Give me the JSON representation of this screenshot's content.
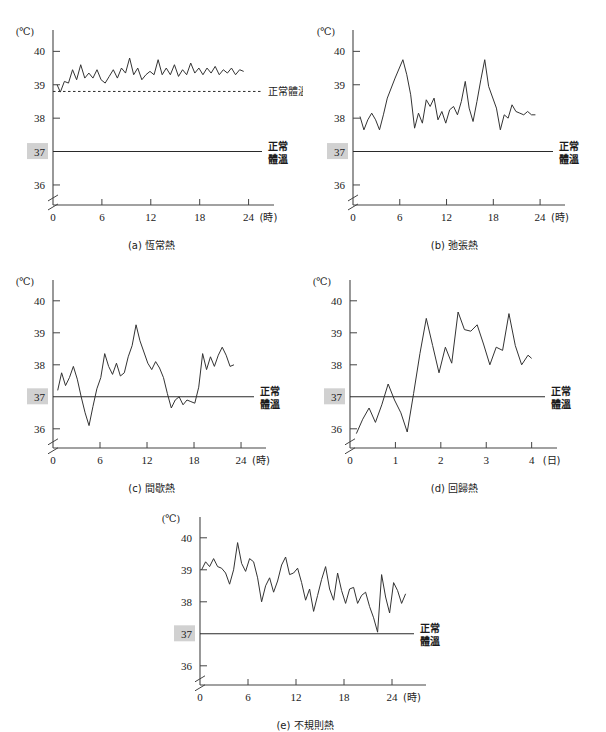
{
  "figure": {
    "title": "",
    "panel_count": 5
  },
  "shared": {
    "y_unit_label": "(℃)",
    "y_ticks": [
      "40",
      "39",
      "38",
      "37",
      "36"
    ],
    "normal_temp_value": "37",
    "normal_temp_label_line1": "正常",
    "normal_temp_label_line2": "體溫",
    "axis_break_icon": "axis-break-zigzag-icon",
    "highlight_color": "#c9c9c9",
    "line_color": "#333333",
    "axis_color": "#444444"
  },
  "chart_data": [
    {
      "id": "a",
      "type": "line",
      "title": "(a) 恆常熱",
      "caption_index": "(a)",
      "caption_name": "恆常熱",
      "xlabel": "(時)",
      "ylabel": "(℃)",
      "x_ticks": [
        0,
        6,
        12,
        18,
        24
      ],
      "x_tick_labels": [
        "0",
        "6",
        "12",
        "18",
        "24"
      ],
      "y_ticks": [
        36,
        37,
        38,
        39,
        40
      ],
      "y_tick_labels": [
        "36",
        "37",
        "38",
        "39",
        "40"
      ],
      "ylim": [
        35.4,
        40.4
      ],
      "xlim": [
        0,
        25.4
      ],
      "grid": false,
      "reference_lines": [
        {
          "name": "normal-body-temperature",
          "value": 37,
          "style": "solid",
          "label": "正常體溫"
        },
        {
          "name": "baseline-38-8",
          "value": 38.8,
          "style": "dashed",
          "label": "38.8℃"
        }
      ],
      "annotations": [
        {
          "text": "38.8℃",
          "value": 38.8
        },
        {
          "text": "正常體溫",
          "value": 37
        }
      ],
      "x": [
        0.5,
        0.9,
        1.4,
        1.9,
        2.4,
        2.9,
        3.4,
        3.9,
        4.4,
        4.9,
        5.4,
        5.9,
        6.4,
        6.9,
        7.4,
        7.9,
        8.4,
        8.9,
        9.4,
        9.9,
        10.4,
        10.9,
        11.4,
        11.9,
        12.4,
        12.9,
        13.4,
        13.9,
        14.4,
        14.9,
        15.4,
        15.9,
        16.4,
        16.9,
        17.4,
        17.9,
        18.4,
        18.9,
        19.4,
        19.9,
        20.4,
        20.9,
        21.4,
        21.9,
        22.4,
        22.9,
        23.4
      ],
      "y": [
        39.0,
        38.78,
        39.1,
        39.05,
        39.45,
        39.15,
        39.6,
        39.2,
        39.35,
        39.2,
        39.45,
        39.15,
        39.05,
        39.25,
        39.45,
        39.2,
        39.5,
        39.35,
        39.8,
        39.3,
        39.5,
        39.15,
        39.3,
        39.4,
        39.3,
        39.75,
        39.3,
        39.5,
        39.3,
        39.6,
        39.25,
        39.45,
        39.3,
        39.65,
        39.35,
        39.5,
        39.3,
        39.5,
        39.35,
        39.55,
        39.3,
        39.45,
        39.35,
        39.5,
        39.3,
        39.45,
        39.4
      ]
    },
    {
      "id": "b",
      "type": "line",
      "title": "(b) 弛張熱",
      "caption_index": "(b)",
      "caption_name": "弛張熱",
      "xlabel": "(時)",
      "ylabel": "(℃)",
      "x_ticks": [
        0,
        6,
        12,
        18,
        24
      ],
      "x_tick_labels": [
        "0",
        "6",
        "12",
        "18",
        "24"
      ],
      "y_ticks": [
        36,
        37,
        38,
        39,
        40
      ],
      "y_tick_labels": [
        "36",
        "37",
        "38",
        "39",
        "40"
      ],
      "ylim": [
        35.4,
        40.4
      ],
      "xlim": [
        0,
        25.4
      ],
      "grid": false,
      "reference_lines": [
        {
          "name": "normal-body-temperature",
          "value": 37,
          "style": "solid",
          "label": "正常體溫"
        }
      ],
      "annotations": [
        {
          "text": "正常體溫",
          "value": 37
        }
      ],
      "x": [
        0.9,
        1.4,
        1.9,
        2.4,
        2.9,
        3.4,
        3.9,
        4.4,
        5.4,
        6.4,
        6.9,
        7.4,
        7.9,
        8.4,
        8.9,
        9.4,
        9.9,
        10.4,
        10.9,
        11.4,
        11.9,
        12.4,
        12.9,
        13.4,
        13.9,
        14.4,
        14.9,
        15.4,
        15.9,
        16.4,
        16.9,
        17.4,
        18.4,
        18.9,
        19.4,
        19.9,
        20.4,
        20.9,
        21.4,
        21.9,
        22.4,
        22.9,
        23.4
      ],
      "y": [
        38.05,
        37.65,
        37.95,
        38.15,
        37.95,
        37.65,
        38.1,
        38.6,
        39.2,
        39.75,
        39.3,
        38.7,
        37.7,
        38.15,
        37.85,
        38.55,
        38.35,
        38.6,
        37.95,
        38.2,
        37.85,
        38.25,
        38.35,
        38.1,
        38.5,
        39.1,
        38.3,
        37.9,
        38.5,
        39.15,
        39.75,
        38.95,
        38.3,
        37.65,
        38.1,
        38.0,
        38.4,
        38.2,
        38.15,
        38.1,
        38.2,
        38.1,
        38.1
      ]
    },
    {
      "id": "c",
      "type": "line",
      "title": "(c) 間歇熱",
      "caption_index": "(c)",
      "caption_name": "間歇熱",
      "xlabel": "(時)",
      "ylabel": "(℃)",
      "x_ticks": [
        0,
        6,
        12,
        18,
        24
      ],
      "x_tick_labels": [
        "0",
        "6",
        "12",
        "18",
        "24"
      ],
      "y_ticks": [
        36,
        37,
        38,
        39,
        40
      ],
      "y_tick_labels": [
        "36",
        "37",
        "38",
        "39",
        "40"
      ],
      "ylim": [
        35.4,
        40.4
      ],
      "xlim": [
        0,
        25.4
      ],
      "grid": false,
      "reference_lines": [
        {
          "name": "normal-body-temperature",
          "value": 37,
          "style": "solid",
          "label": "正常體溫"
        }
      ],
      "annotations": [
        {
          "text": "正常體溫",
          "value": 37
        }
      ],
      "x": [
        0.6,
        1.1,
        1.6,
        2.1,
        2.6,
        3.1,
        3.6,
        4.1,
        4.6,
        5.1,
        5.6,
        6.1,
        6.6,
        7.1,
        7.6,
        8.1,
        8.6,
        9.1,
        9.6,
        10.1,
        10.6,
        11.1,
        11.6,
        12.1,
        12.6,
        13.1,
        13.6,
        14.1,
        14.6,
        15.1,
        15.6,
        16.1,
        16.6,
        17.1,
        17.6,
        18.1,
        18.6,
        19.1,
        19.6,
        20.1,
        20.6,
        21.1,
        21.6,
        22.1,
        22.6,
        23.1
      ],
      "y": [
        37.2,
        37.75,
        37.35,
        37.6,
        37.95,
        37.55,
        37.0,
        36.5,
        36.1,
        36.7,
        37.25,
        37.6,
        38.35,
        37.95,
        37.7,
        38.05,
        37.65,
        37.75,
        38.25,
        38.6,
        39.25,
        38.75,
        38.4,
        38.05,
        37.85,
        38.1,
        37.9,
        37.6,
        37.1,
        36.65,
        36.9,
        37.0,
        36.75,
        36.9,
        36.85,
        36.8,
        37.3,
        38.35,
        37.85,
        38.25,
        37.95,
        38.3,
        38.55,
        38.3,
        37.95,
        38.0
      ]
    },
    {
      "id": "d",
      "type": "line",
      "title": "(d) 回歸熱",
      "caption_index": "(d)",
      "caption_name": "回歸熱",
      "xlabel": "(日)",
      "ylabel": "(℃)",
      "x_ticks": [
        0,
        1,
        2,
        3,
        4
      ],
      "x_tick_labels": [
        "0",
        "1",
        "2",
        "3",
        "4"
      ],
      "y_ticks": [
        36,
        37,
        38,
        39,
        40
      ],
      "y_tick_labels": [
        "36",
        "37",
        "38",
        "39",
        "40"
      ],
      "ylim": [
        35.4,
        40.4
      ],
      "xlim": [
        0,
        4.25
      ],
      "grid": false,
      "reference_lines": [
        {
          "name": "normal-body-temperature",
          "value": 37,
          "style": "solid",
          "label": "正常體溫"
        }
      ],
      "annotations": [
        {
          "text": "正常體溫",
          "value": 37
        }
      ],
      "x": [
        0.14,
        0.28,
        0.42,
        0.56,
        0.7,
        0.84,
        0.98,
        1.12,
        1.26,
        1.4,
        1.54,
        1.68,
        1.82,
        1.96,
        2.1,
        2.24,
        2.38,
        2.52,
        2.66,
        2.8,
        2.94,
        3.08,
        3.22,
        3.36,
        3.5,
        3.64,
        3.78,
        3.92,
        4.0
      ],
      "y": [
        35.85,
        36.3,
        36.65,
        36.2,
        36.75,
        37.4,
        36.9,
        36.5,
        35.9,
        37.1,
        38.35,
        39.45,
        38.6,
        37.75,
        38.55,
        38.05,
        39.65,
        39.1,
        39.05,
        39.25,
        38.65,
        38.0,
        38.55,
        38.45,
        39.6,
        38.6,
        38.0,
        38.3,
        38.2
      ]
    },
    {
      "id": "e",
      "type": "line",
      "title": "(e) 不規則熱",
      "caption_index": "(e)",
      "caption_name": "不規則熱",
      "xlabel": "(時)",
      "ylabel": "(℃)",
      "x_ticks": [
        0,
        6,
        12,
        18,
        24
      ],
      "x_tick_labels": [
        "0",
        "6",
        "12",
        "18",
        "24"
      ],
      "y_ticks": [
        36,
        37,
        38,
        39,
        40
      ],
      "y_tick_labels": [
        "36",
        "37",
        "38",
        "39",
        "40"
      ],
      "ylim": [
        35.4,
        40.4
      ],
      "xlim": [
        0,
        26.5
      ],
      "grid": false,
      "reference_lines": [
        {
          "name": "normal-body-temperature",
          "value": 37,
          "style": "solid",
          "label": "正常體溫"
        }
      ],
      "annotations": [
        {
          "text": "正常體溫",
          "value": 37
        }
      ],
      "x": [
        0.2,
        0.7,
        1.2,
        1.7,
        2.2,
        2.7,
        3.2,
        3.7,
        4.2,
        4.7,
        5.2,
        5.7,
        6.2,
        6.7,
        7.2,
        7.7,
        8.2,
        8.7,
        9.2,
        9.7,
        10.2,
        10.7,
        11.2,
        11.7,
        12.2,
        12.7,
        13.2,
        13.7,
        14.2,
        14.7,
        15.2,
        15.7,
        16.2,
        16.7,
        17.2,
        17.7,
        18.2,
        18.7,
        19.2,
        19.7,
        20.2,
        20.7,
        21.2,
        21.7,
        22.2,
        22.7,
        23.2,
        23.7,
        24.2,
        24.7,
        25.2,
        25.7
      ],
      "y": [
        39.0,
        39.25,
        39.1,
        39.35,
        39.1,
        39.05,
        38.9,
        38.55,
        39.0,
        39.85,
        39.2,
        38.95,
        39.35,
        39.25,
        38.75,
        38.0,
        38.5,
        38.75,
        38.3,
        38.65,
        39.15,
        39.4,
        38.85,
        38.9,
        39.05,
        38.6,
        38.05,
        38.4,
        37.7,
        38.2,
        38.7,
        39.1,
        38.4,
        38.05,
        38.9,
        38.35,
        37.95,
        38.4,
        38.45,
        37.95,
        38.2,
        38.3,
        37.85,
        37.5,
        37.05,
        38.85,
        38.15,
        37.65,
        38.6,
        38.35,
        37.95,
        38.25
      ]
    }
  ]
}
